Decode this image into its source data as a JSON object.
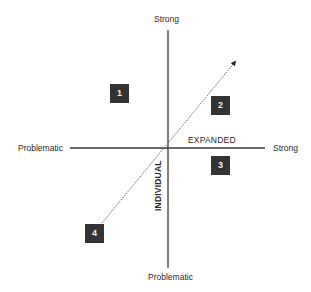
{
  "diagram": {
    "vertical_axis": {
      "top_label": "Strong",
      "bottom_label": "Problematic",
      "name": "INDIVIDUAL"
    },
    "horizontal_axis": {
      "left_label": "Problematic",
      "right_label": "Strong",
      "name": "EXPANDED"
    },
    "quadrant_boxes": [
      {
        "label": "1",
        "position": "upper-left"
      },
      {
        "label": "2",
        "position": "upper-right"
      },
      {
        "label": "3",
        "position": "lower-right"
      },
      {
        "label": "4",
        "position": "lower-left"
      }
    ],
    "trajectory": {
      "style": "dotted-arrow",
      "from_box": "4",
      "direction": "upper-right"
    },
    "colors": {
      "axis": "#3a3a3a",
      "box_fill": "#333333",
      "box_text": "#f2f2f2",
      "background": "#ffffff"
    }
  }
}
